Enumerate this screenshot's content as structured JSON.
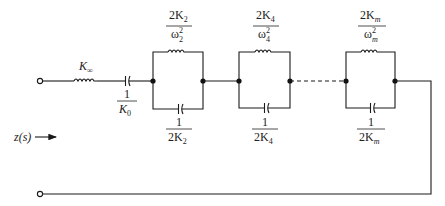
{
  "diagram": {
    "input_label": "z(s)",
    "series_inductor": {
      "label_main": "K",
      "label_sub": "∞"
    },
    "series_capacitor": {
      "numerator": "1",
      "denominator_main": "K",
      "denominator_sub": "0"
    },
    "sections": [
      {
        "inductor": {
          "num_coef": "2K",
          "num_sub": "2",
          "den_main": "ω",
          "den_sub": "2",
          "den_sup": "2"
        },
        "capacitor": {
          "numerator": "1",
          "den_coef": "2K",
          "den_sub": "2"
        }
      },
      {
        "inductor": {
          "num_coef": "2K",
          "num_sub": "4",
          "den_main": "ω",
          "den_sub": "4",
          "den_sup": "2"
        },
        "capacitor": {
          "numerator": "1",
          "den_coef": "2K",
          "den_sub": "4"
        }
      },
      {
        "inductor": {
          "num_coef": "2K",
          "num_sub": "m",
          "den_main": "ω",
          "den_sub": "m",
          "den_sup": "2"
        },
        "capacitor": {
          "numerator": "1",
          "den_coef": "2K",
          "den_sub": "m"
        }
      }
    ],
    "colors": {
      "line": "#1a1a1a",
      "background": "#ffffff"
    }
  }
}
